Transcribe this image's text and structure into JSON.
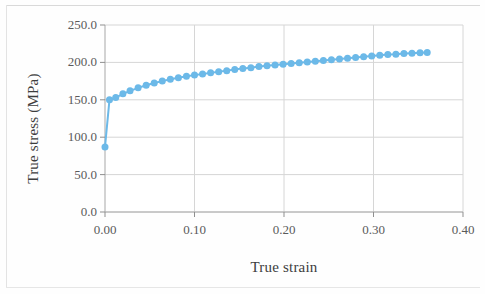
{
  "figure": {
    "background_color": "#fefefe",
    "plot_background_color": "#ffffff",
    "border_color": "#d9d9d9"
  },
  "chart_data": {
    "type": "line",
    "title": "",
    "subtitle": "",
    "xlabel": "True strain",
    "ylabel": "True stress (MPa)",
    "xlim": [
      0.0,
      0.4
    ],
    "ylim": [
      0.0,
      250.0
    ],
    "xticks": [
      0.0,
      0.1,
      0.2,
      0.3,
      0.4
    ],
    "xtick_labels": [
      "0.00",
      "0.10",
      "0.20",
      "0.30",
      "0.40"
    ],
    "yticks": [
      0.0,
      50.0,
      100.0,
      150.0,
      200.0,
      250.0
    ],
    "ytick_labels": [
      "0.0",
      "50.0",
      "100.0",
      "150.0",
      "200.0",
      "250.0"
    ],
    "grid": true,
    "grid_color": "#d6d6d6",
    "legend": false,
    "legend_position": "none",
    "marker": "circle",
    "marker_size": 7,
    "series": [
      {
        "name": "True stress-strain curve",
        "color": "#6cb9e8",
        "line_color": "#6cb9e8",
        "x": [
          0.0,
          0.005,
          0.012,
          0.02,
          0.028,
          0.037,
          0.046,
          0.055,
          0.064,
          0.073,
          0.082,
          0.091,
          0.1,
          0.109,
          0.118,
          0.127,
          0.136,
          0.145,
          0.154,
          0.163,
          0.172,
          0.181,
          0.19,
          0.199,
          0.208,
          0.217,
          0.226,
          0.235,
          0.244,
          0.253,
          0.262,
          0.271,
          0.28,
          0.289,
          0.298,
          0.307,
          0.316,
          0.325,
          0.334,
          0.343,
          0.352,
          0.36
        ],
        "y": [
          87.0,
          150.0,
          153.0,
          158.0,
          162.0,
          166.0,
          169.5,
          172.5,
          175.0,
          177.5,
          179.5,
          181.5,
          183.0,
          184.5,
          186.0,
          187.5,
          189.0,
          190.5,
          192.0,
          193.0,
          194.5,
          195.5,
          196.5,
          197.5,
          198.5,
          199.5,
          200.5,
          201.5,
          202.5,
          203.5,
          204.5,
          205.5,
          206.5,
          207.5,
          208.5,
          209.5,
          210.5,
          211.0,
          211.8,
          212.3,
          212.8,
          213.2
        ]
      }
    ]
  }
}
